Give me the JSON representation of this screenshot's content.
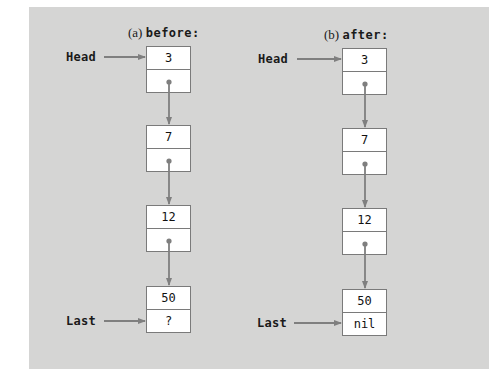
{
  "diagrams": [
    {
      "id": "a",
      "caption_tag": "(a)",
      "caption_word": "before:",
      "head_label": "Head",
      "last_label": "Last",
      "nodes": [
        {
          "value": "3",
          "next": ""
        },
        {
          "value": "7",
          "next": ""
        },
        {
          "value": "12",
          "next": ""
        },
        {
          "value": "50",
          "next": "?"
        }
      ]
    },
    {
      "id": "b",
      "caption_tag": "(b)",
      "caption_word": "after:",
      "head_label": "Head",
      "last_label": "Last",
      "nodes": [
        {
          "value": "3",
          "next": ""
        },
        {
          "value": "7",
          "next": ""
        },
        {
          "value": "12",
          "next": ""
        },
        {
          "value": "50",
          "next": "nil"
        }
      ]
    }
  ],
  "colors": {
    "panel_background": "#d5d5d4",
    "node_border": "#7a7a7a",
    "arrow": "#7f7f7f",
    "node_fill": "#ffffff"
  }
}
